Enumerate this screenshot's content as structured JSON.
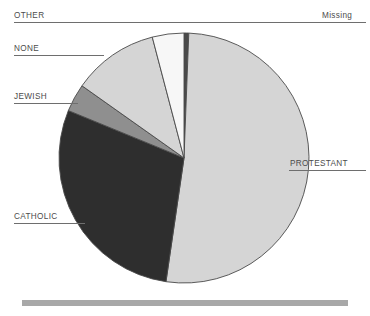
{
  "chart_data": {
    "type": "pie",
    "title": "",
    "subtitle": "",
    "xlabel": "",
    "ylabel": "",
    "legend_position": "none",
    "grid": false,
    "start_angle_deg": 0,
    "direction": "clockwise",
    "categories": [
      "Missing",
      "PROTESTANT",
      "CATHOLIC",
      "JEWISH",
      "NONE",
      "OTHER"
    ],
    "values": [
      0.6,
      51.7,
      28.9,
      3.6,
      11.1,
      4.1
    ],
    "units": "percent",
    "slices": [
      {
        "label": "Missing",
        "value": 0.6,
        "start_deg": 0.0,
        "end_deg": 2.2,
        "color": "#4a4a4a",
        "label_side": "right",
        "label_x": 322,
        "label_y": 11,
        "leader_y": 22,
        "leader_x1": 258,
        "leader_x2": 366
      },
      {
        "label": "PROTESTANT",
        "value": 51.7,
        "start_deg": 2.2,
        "end_deg": 188.3,
        "color": "#d5d5d5",
        "label_side": "right",
        "label_x": 290,
        "label_y": 159,
        "leader_y": 170,
        "leader_x1": 289,
        "leader_x2": 366
      },
      {
        "label": "CATHOLIC",
        "value": 28.9,
        "start_deg": 188.3,
        "end_deg": 292.3,
        "color": "#2e2e2e",
        "label_side": "left",
        "label_x": 14,
        "label_y": 212,
        "leader_y": 223,
        "leader_x1": 14,
        "leader_x2": 85
      },
      {
        "label": "JEWISH",
        "value": 3.6,
        "start_deg": 292.3,
        "end_deg": 305.3,
        "color": "#8f8f8f",
        "label_side": "left",
        "label_x": 14,
        "label_y": 92,
        "leader_y": 103,
        "leader_x1": 14,
        "leader_x2": 78
      },
      {
        "label": "NONE",
        "value": 11.1,
        "start_deg": 305.3,
        "end_deg": 345.3,
        "color": "#d5d5d5",
        "label_side": "left",
        "label_x": 14,
        "label_y": 44,
        "leader_y": 55,
        "leader_x1": 14,
        "leader_x2": 104
      },
      {
        "label": "OTHER",
        "value": 4.1,
        "start_deg": 345.3,
        "end_deg": 360.0,
        "color": "#f7f7f7",
        "label_side": "left",
        "label_x": 14,
        "label_y": 11,
        "leader_y": 22,
        "leader_x1": 14,
        "leader_x2": 258
      }
    ],
    "geometry": {
      "center_x": 184,
      "center_y": 158,
      "radius": 125
    },
    "annotations": []
  },
  "figure": {
    "background_color": "#ffffff",
    "outline_color": "#4a4a4a",
    "leader_color": "#6e6e6e",
    "label_color": "#4c4c4c",
    "footer_bar_color": "#a8a8a8"
  }
}
